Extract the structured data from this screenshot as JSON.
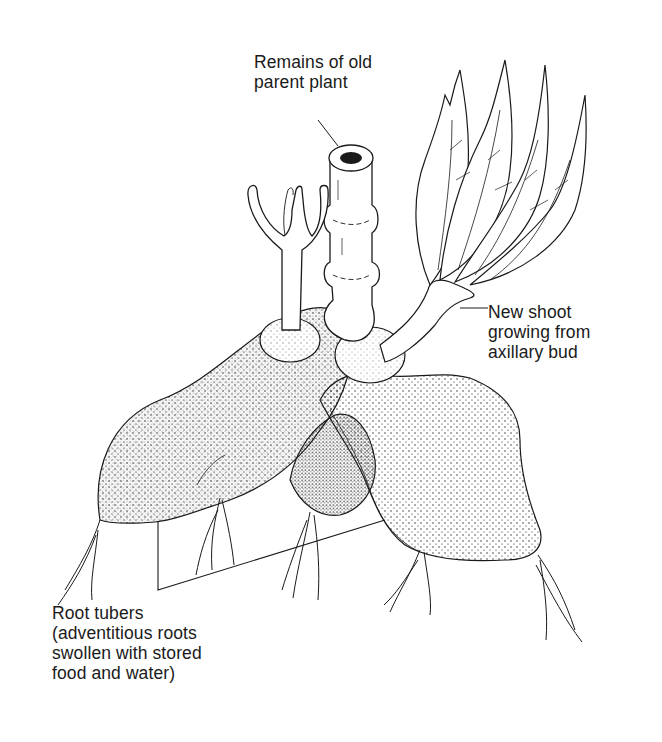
{
  "figure": {
    "colors": {
      "ink": "#1a1a1a",
      "background": "#ffffff"
    }
  },
  "labels": {
    "parent_plant": {
      "line1": "Remains of old",
      "line2": "parent plant"
    },
    "new_shoot": {
      "line1": "New shoot",
      "line2": "growing from",
      "line3": "axillary bud"
    },
    "root_tubers": {
      "line1": "Root tubers",
      "line2": "(adventitious roots",
      "line3": "swollen with stored",
      "line4": "food and water)"
    }
  }
}
